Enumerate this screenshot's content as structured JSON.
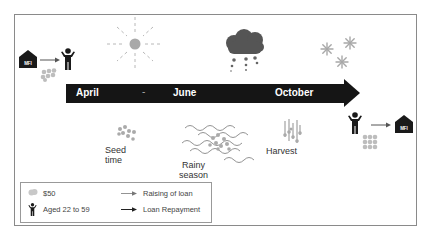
{
  "diagram": {
    "timeline": {
      "months": [
        "April",
        "June",
        "October"
      ],
      "separator": "-"
    },
    "stages": {
      "seed_time": [
        "Seed",
        "time"
      ],
      "rainy_season": [
        "Rainy",
        "season"
      ],
      "harvest": "Harvest"
    },
    "mfi_label": "MFI",
    "weather_icons": [
      "sun-icon",
      "rain-cloud-icon",
      "snowflake-icon"
    ],
    "legend": {
      "coin_label": "$50",
      "person_label": "Aged 22 to 59",
      "raising_label": "Raising of loan",
      "repayment_label": "Loan Repayment"
    },
    "colors": {
      "timeline": "#151515",
      "coins": "#b5b5b5",
      "icons": "#1a1a1a",
      "sun": "#aaaaaa",
      "cloud": "#555555"
    }
  }
}
